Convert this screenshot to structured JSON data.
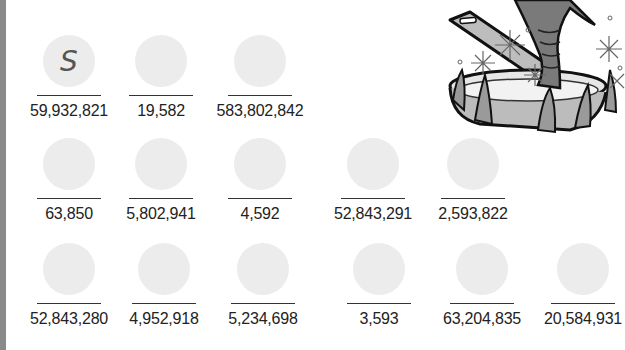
{
  "worksheet": {
    "illustration": "fish-in-frying-pan-icon",
    "rows": [
      {
        "items": [
          {
            "number": "59,932,821",
            "answer": "S"
          },
          {
            "number": "19,582",
            "answer": ""
          },
          {
            "number": "583,802,842",
            "answer": ""
          }
        ]
      },
      {
        "items": [
          {
            "number": "63,850",
            "answer": ""
          },
          {
            "number": "5,802,941",
            "answer": ""
          },
          {
            "number": "4,592",
            "answer": ""
          },
          {
            "number": "52,843,291",
            "answer": ""
          },
          {
            "number": "2,593,822",
            "answer": ""
          }
        ]
      },
      {
        "items": [
          {
            "number": "52,843,280",
            "answer": ""
          },
          {
            "number": "4,952,918",
            "answer": ""
          },
          {
            "number": "5,234,698",
            "answer": ""
          },
          {
            "number": "3,593",
            "answer": ""
          },
          {
            "number": "63,204,835",
            "answer": ""
          },
          {
            "number": "20,584,931",
            "answer": ""
          }
        ]
      }
    ]
  },
  "colors": {
    "circle_fill": "#ececec",
    "edge_bar": "#8a8a8a",
    "text": "#222222"
  }
}
